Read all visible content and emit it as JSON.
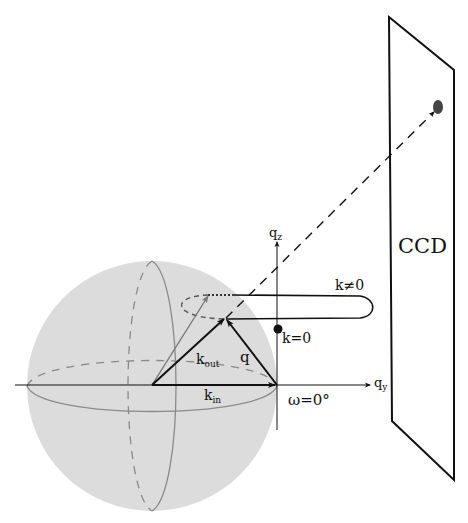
{
  "diagram": {
    "title": "",
    "detector": {
      "label": "CCD"
    },
    "axes": {
      "qz": {
        "base": "q",
        "sub": "z"
      },
      "qy": {
        "base": "q",
        "sub": "y"
      }
    },
    "vectors": {
      "k_in": {
        "base": "k",
        "sub": "in"
      },
      "k_out": {
        "base": "k",
        "sub": "out"
      },
      "q": {
        "label": "q"
      }
    },
    "annotations": {
      "k_nonzero": "k≠0",
      "k_zero": "k=0",
      "omega": "ω=0°"
    },
    "colors": {
      "sphere_fill": "#dcdcdc",
      "sphere_line": "#8a8a8a",
      "ink": "#111111",
      "spot": "#444444"
    }
  }
}
